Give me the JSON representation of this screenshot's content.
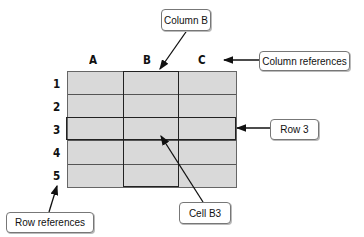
{
  "diagram": {
    "column_headers": [
      "A",
      "B",
      "C"
    ],
    "row_headers": [
      "1",
      "2",
      "3",
      "4",
      "5"
    ],
    "highlighted_column": "B",
    "highlighted_row": "3",
    "highlighted_cell": "B3",
    "colors": {
      "cell_fill": "#d9d9d9",
      "grid_line": "#555555",
      "highlight_border": "#222222"
    }
  },
  "callouts": {
    "column_b": "Column B",
    "column_references": "Column references",
    "row_3": "Row 3",
    "row_references": "Row references",
    "cell_b3": "Cell B3"
  }
}
